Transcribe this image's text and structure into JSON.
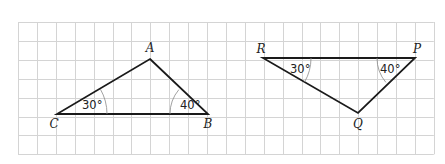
{
  "grid": {
    "x0": 18,
    "y0": 22,
    "cols": 22,
    "rows": 7,
    "cell": 18.9,
    "line_color": "#d4d4d4"
  },
  "triangles": [
    {
      "name": "ABC",
      "vertices": {
        "A": {
          "label": "A",
          "x": 150,
          "y": 59,
          "lx": 150,
          "ly": 52
        },
        "B": {
          "label": "B",
          "x": 208,
          "y": 114,
          "lx": 208,
          "ly": 128
        },
        "C": {
          "label": "C",
          "x": 57,
          "y": 114,
          "lx": 54,
          "ly": 128
        }
      },
      "angles": [
        {
          "at": "C",
          "value": "30°",
          "arc_r": 50,
          "from_deg": 0,
          "to_deg": -30,
          "tx": 82,
          "ty": 109
        },
        {
          "at": "B",
          "value": "40°",
          "arc_r": 38,
          "from_deg": 180,
          "to_deg": 220,
          "tx": 180,
          "ty": 109
        }
      ]
    },
    {
      "name": "PQR",
      "vertices": {
        "R": {
          "label": "R",
          "x": 263,
          "y": 58,
          "lx": 261,
          "ly": 53
        },
        "P": {
          "label": "P",
          "x": 415,
          "y": 58,
          "lx": 417,
          "ly": 53
        },
        "Q": {
          "label": "Q",
          "x": 358,
          "y": 113,
          "lx": 358,
          "ly": 128
        }
      },
      "angles": [
        {
          "at": "R",
          "value": "30°",
          "arc_r": 48,
          "from_deg": 0,
          "to_deg": 30,
          "tx": 290,
          "ty": 73
        },
        {
          "at": "P",
          "value": "40°",
          "arc_r": 38,
          "from_deg": 180,
          "to_deg": 140,
          "tx": 380,
          "ty": 73
        }
      ]
    }
  ],
  "labels": {
    "A": "A",
    "B": "B",
    "C": "C",
    "P": "P",
    "Q": "Q",
    "R": "R",
    "angle_C": "30°",
    "angle_B": "40°",
    "angle_R": "30°",
    "angle_P": "40°"
  }
}
